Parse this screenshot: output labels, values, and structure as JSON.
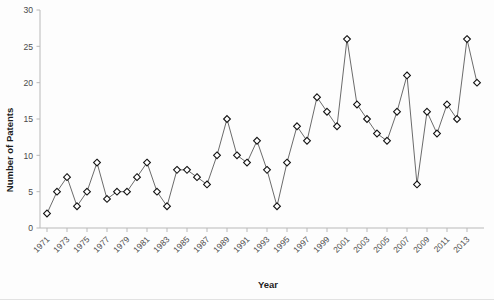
{
  "chart_data": {
    "type": "line",
    "title": "",
    "xlabel": "Year",
    "ylabel": "Number of Patents",
    "xlim": [
      1970.3,
      2014.7
    ],
    "ylim": [
      0,
      30
    ],
    "yticks": [
      0,
      5,
      10,
      15,
      20,
      25,
      30
    ],
    "ytick_labels": [
      "0",
      "5",
      "10",
      "15",
      "20",
      "25",
      "30"
    ],
    "xticks": [
      1971,
      1973,
      1975,
      1977,
      1979,
      1981,
      1983,
      1985,
      1987,
      1989,
      1991,
      1993,
      1995,
      1997,
      1999,
      2001,
      2003,
      2005,
      2007,
      2009,
      2011,
      2013
    ],
    "xtick_labels": [
      "1971",
      "1973",
      "1975",
      "1977",
      "1979",
      "1981",
      "1983",
      "1985",
      "1987",
      "1989",
      "1991",
      "1993",
      "1995",
      "1997",
      "1999",
      "2001",
      "2003",
      "2005",
      "2007",
      "2009",
      "2011",
      "2013"
    ],
    "grid": false,
    "legend": false,
    "marker": "diamond",
    "marker_fill": "#ffffff",
    "marker_edge": "#111111",
    "line_color": "#5a5a5a",
    "x": [
      1971,
      1972,
      1973,
      1974,
      1975,
      1976,
      1977,
      1978,
      1979,
      1980,
      1981,
      1982,
      1983,
      1984,
      1985,
      1986,
      1987,
      1988,
      1989,
      1990,
      1991,
      1992,
      1993,
      1994,
      1995,
      1996,
      1997,
      1998,
      1999,
      2000,
      2001,
      2002,
      2003,
      2004,
      2005,
      2006,
      2007,
      2008,
      2009,
      2010,
      2011,
      2012,
      2013,
      2014
    ],
    "values": [
      2,
      5,
      7,
      3,
      5,
      9,
      4,
      5,
      5,
      7,
      9,
      5,
      3,
      8,
      8,
      7,
      6,
      10,
      15,
      10,
      9,
      12,
      8,
      3,
      9,
      14,
      12,
      18,
      16,
      14,
      26,
      17,
      15,
      13,
      12,
      16,
      21,
      6,
      16,
      13,
      17,
      15,
      26,
      20
    ],
    "series": [
      {
        "name": "Number of Patents",
        "values": [
          2,
          5,
          7,
          3,
          5,
          9,
          4,
          5,
          5,
          7,
          9,
          5,
          3,
          8,
          8,
          7,
          6,
          10,
          15,
          10,
          9,
          12,
          8,
          3,
          9,
          14,
          12,
          18,
          16,
          14,
          26,
          17,
          15,
          13,
          12,
          16,
          21,
          6,
          16,
          13,
          17,
          15,
          26,
          20
        ]
      }
    ]
  }
}
